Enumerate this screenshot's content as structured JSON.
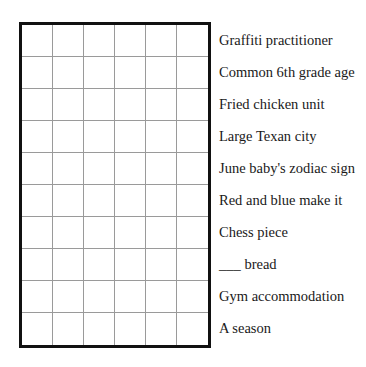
{
  "puzzle": {
    "rows": 10,
    "columns": 6,
    "grid_border_color": "#111111",
    "grid_line_color": "#9a9a9a",
    "cells": [
      [
        "",
        "",
        "",
        "",
        "",
        ""
      ],
      [
        "",
        "",
        "",
        "",
        "",
        ""
      ],
      [
        "",
        "",
        "",
        "",
        "",
        ""
      ],
      [
        "",
        "",
        "",
        "",
        "",
        ""
      ],
      [
        "",
        "",
        "",
        "",
        "",
        ""
      ],
      [
        "",
        "",
        "",
        "",
        "",
        ""
      ],
      [
        "",
        "",
        "",
        "",
        "",
        ""
      ],
      [
        "",
        "",
        "",
        "",
        "",
        ""
      ],
      [
        "",
        "",
        "",
        "",
        "",
        ""
      ],
      [
        "",
        "",
        "",
        "",
        "",
        ""
      ]
    ]
  },
  "clues": [
    "Graffiti practitioner",
    "Common 6th grade age",
    "Fried chicken unit",
    "Large Texan city",
    "June baby's zodiac sign",
    "Red and blue make it",
    "Chess piece",
    "___ bread",
    "Gym accommodation",
    "A season"
  ]
}
